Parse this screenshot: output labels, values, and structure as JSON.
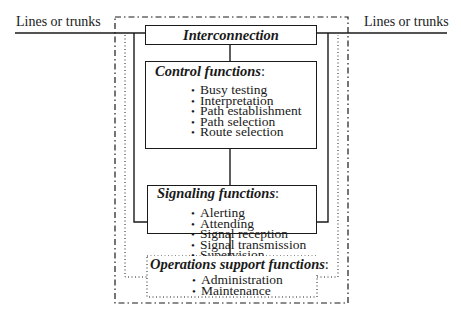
{
  "diagram": {
    "external_left_label": "Lines or trunks",
    "external_right_label": "Lines or trunks",
    "interconnection": {
      "title": "Interconnection"
    },
    "control": {
      "title": "Control functions",
      "colon": ":",
      "items": [
        "Busy testing",
        "Interpretation",
        "Path establishment",
        "Path selection",
        "Route selection"
      ]
    },
    "signaling": {
      "title": "Signaling functions",
      "colon": ":",
      "items": [
        "Alerting",
        "Attending",
        "Signal reception",
        "Signal transmission",
        "Supervision"
      ]
    },
    "operations": {
      "title": "Operations support functions",
      "colon": ":",
      "items": [
        "Administration",
        "Maintenance"
      ]
    },
    "colors": {
      "line": "#1a1a1a",
      "background": "#ffffff"
    }
  }
}
